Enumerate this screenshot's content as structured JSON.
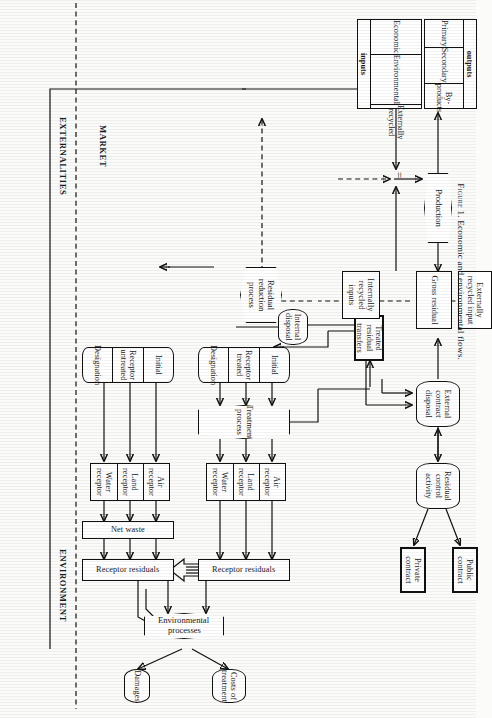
{
  "figure": {
    "caption_prefix": "Figure 1.",
    "caption_text": "Economic and environmental flows.",
    "equals_sign": "="
  },
  "zones": {
    "market": "MARKET",
    "externalities": "EXTERNALITIES",
    "environment": "ENVIRONMENT"
  },
  "inputs_table": {
    "span_label": "inputs",
    "cells": [
      "Economic",
      "Environmental",
      "Externally recycled"
    ]
  },
  "outputs_table": {
    "span_label": "outputs",
    "cells": [
      "Primary",
      "Secondary",
      "By-products"
    ]
  },
  "nodes": {
    "production": "Production",
    "gross_residual": "Gross residual",
    "internally_recycled_inputs": "Internally recycled inputs",
    "residual_reduction_process": "Residual reduction process",
    "externally_recycled_input": "Externally recycled input",
    "external_contract_disposal": "External contract disposal",
    "residual_control_activity": "Residual control activity",
    "public_contract": "Public contract",
    "private_contract": "Private contract",
    "treated_residual_transfers": "Treated residual transfers",
    "internal_disposal": "Internal disposal",
    "treatment_process": "Treatment process",
    "environmental_processes": "Environmental processes",
    "net_waste": "Net waste",
    "damages": "Damages",
    "costs_of_treatment": "Costs of treatment"
  },
  "receptor_treated": {
    "initial": "Initial",
    "middle": "Receptor treated",
    "designation": "Designation"
  },
  "receptor_untreated": {
    "initial": "Initial",
    "middle": "Receptor untreated",
    "designation": "Designation"
  },
  "receptors_treated_branch": {
    "air": "Air receptor",
    "land": "Land receptor",
    "water": "Water receptor"
  },
  "receptors_untreated_branch": {
    "air": "Air receptor",
    "land": "Land receptor",
    "water": "Water receptor"
  },
  "receptor_residuals_upper": "Receptor residuals",
  "receptor_residuals_lower": "Receptor residuals",
  "colors": {
    "ink": "#111111",
    "paper": "#fbfbf9"
  }
}
